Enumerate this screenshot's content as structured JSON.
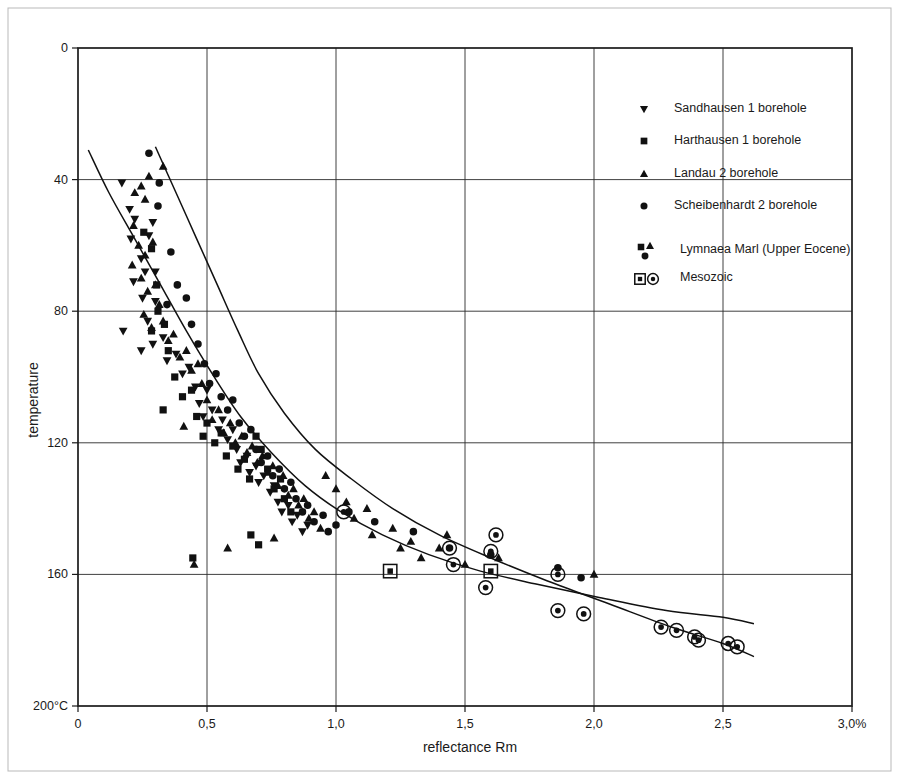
{
  "chart_data": {
    "type": "scatter",
    "title": "",
    "xlabel": "reflectance Rm",
    "ylabel": "temperature",
    "xlim": [
      0,
      3.0
    ],
    "ylim": [
      0,
      200
    ],
    "y_inverted": true,
    "grid": true,
    "x_ticks": [
      "0",
      "0,5",
      "1,0",
      "1,5",
      "2,0",
      "2,5",
      "3,0%"
    ],
    "x_tick_values": [
      0,
      0.5,
      1.0,
      1.5,
      2.0,
      2.5,
      3.0
    ],
    "y_ticks": [
      "0",
      "40",
      "80",
      "120",
      "160",
      "200°C"
    ],
    "y_tick_values": [
      0,
      40,
      80,
      120,
      160,
      200
    ],
    "legend_position": "top-right",
    "legend": [
      {
        "marker": "triangle-down",
        "label": "Sandhausen 1 borehole"
      },
      {
        "marker": "square",
        "label": "Harthausen 1 borehole"
      },
      {
        "marker": "triangle-up",
        "label": "Landau 2 borehole"
      },
      {
        "marker": "circle",
        "label": "Scheibenhardt 2 borehole"
      },
      {
        "marker": "group-cluster",
        "label": "Lymnaea Marl (Upper Eocene)"
      },
      {
        "marker": "outlined-pair",
        "label": "Mesozoic"
      }
    ],
    "annotations": [
      {
        "name": "upper-envelope",
        "description": "upper bounding trend curve"
      },
      {
        "name": "lower-envelope",
        "description": "lower bounding trend curve"
      }
    ],
    "envelopes": {
      "upper": [
        [
          0.04,
          31
        ],
        [
          0.12,
          44
        ],
        [
          0.22,
          58
        ],
        [
          0.32,
          72
        ],
        [
          0.42,
          86
        ],
        [
          0.52,
          99
        ],
        [
          0.63,
          112
        ],
        [
          0.75,
          123
        ],
        [
          0.88,
          133
        ],
        [
          1.02,
          141
        ],
        [
          1.18,
          148
        ],
        [
          1.36,
          154
        ],
        [
          1.56,
          159
        ],
        [
          1.78,
          163
        ],
        [
          2.02,
          167
        ],
        [
          2.28,
          171
        ],
        [
          2.5,
          173
        ],
        [
          2.62,
          175
        ]
      ],
      "lower": [
        [
          0.3,
          30
        ],
        [
          0.38,
          44
        ],
        [
          0.46,
          58
        ],
        [
          0.54,
          72
        ],
        [
          0.62,
          86
        ],
        [
          0.7,
          99
        ],
        [
          0.8,
          111
        ],
        [
          0.92,
          122
        ],
        [
          1.06,
          131
        ],
        [
          1.22,
          140
        ],
        [
          1.4,
          148
        ],
        [
          1.6,
          155
        ],
        [
          1.82,
          162
        ],
        [
          2.06,
          169
        ],
        [
          2.3,
          176
        ],
        [
          2.5,
          181
        ],
        [
          2.62,
          185
        ]
      ]
    },
    "series": [
      {
        "name": "Sandhausen 1 borehole",
        "marker": "triangle-down",
        "points": [
          [
            0.17,
            41
          ],
          [
            0.2,
            49
          ],
          [
            0.22,
            52
          ],
          [
            0.205,
            58
          ],
          [
            0.275,
            57
          ],
          [
            0.29,
            53
          ],
          [
            0.245,
            64
          ],
          [
            0.26,
            68
          ],
          [
            0.215,
            71
          ],
          [
            0.3,
            68
          ],
          [
            0.25,
            76
          ],
          [
            0.3,
            77
          ],
          [
            0.27,
            83
          ],
          [
            0.175,
            86
          ],
          [
            0.245,
            92
          ],
          [
            0.29,
            90
          ],
          [
            0.33,
            88
          ],
          [
            0.345,
            95
          ],
          [
            0.38,
            93
          ],
          [
            0.405,
            99
          ],
          [
            0.43,
            97
          ],
          [
            0.455,
            103
          ],
          [
            0.47,
            108
          ],
          [
            0.5,
            104
          ],
          [
            0.485,
            112
          ],
          [
            0.52,
            110
          ],
          [
            0.545,
            116
          ],
          [
            0.56,
            113
          ],
          [
            0.58,
            119
          ],
          [
            0.6,
            116
          ],
          [
            0.615,
            122
          ],
          [
            0.63,
            126
          ],
          [
            0.655,
            124
          ],
          [
            0.665,
            129
          ],
          [
            0.69,
            127
          ],
          [
            0.7,
            132
          ],
          [
            0.72,
            130
          ],
          [
            0.745,
            135
          ],
          [
            0.76,
            133
          ],
          [
            0.775,
            138
          ],
          [
            0.79,
            141
          ],
          [
            0.815,
            139
          ],
          [
            0.83,
            144
          ],
          [
            0.85,
            142
          ],
          [
            0.87,
            147
          ],
          [
            0.89,
            145
          ]
        ]
      },
      {
        "name": "Harthausen 1 borehole",
        "marker": "square",
        "points": [
          [
            0.255,
            56
          ],
          [
            0.285,
            61
          ],
          [
            0.305,
            72
          ],
          [
            0.31,
            80
          ],
          [
            0.285,
            86
          ],
          [
            0.335,
            84
          ],
          [
            0.35,
            92
          ],
          [
            0.375,
            100
          ],
          [
            0.405,
            106
          ],
          [
            0.33,
            110
          ],
          [
            0.44,
            104
          ],
          [
            0.46,
            112
          ],
          [
            0.485,
            118
          ],
          [
            0.5,
            114
          ],
          [
            0.53,
            120
          ],
          [
            0.555,
            117
          ],
          [
            0.575,
            124
          ],
          [
            0.6,
            121
          ],
          [
            0.62,
            128
          ],
          [
            0.645,
            125
          ],
          [
            0.665,
            131
          ],
          [
            0.69,
            118
          ],
          [
            0.71,
            122
          ],
          [
            0.735,
            128
          ],
          [
            0.76,
            134
          ],
          [
            0.785,
            131
          ],
          [
            0.8,
            137
          ],
          [
            0.825,
            141
          ],
          [
            0.67,
            148
          ],
          [
            0.7,
            151
          ],
          [
            0.445,
            155
          ]
        ]
      },
      {
        "name": "Landau 2 borehole",
        "marker": "triangle-up",
        "points": [
          [
            0.22,
            44
          ],
          [
            0.245,
            42
          ],
          [
            0.26,
            46
          ],
          [
            0.275,
            39
          ],
          [
            0.33,
            36
          ],
          [
            0.215,
            54
          ],
          [
            0.235,
            60
          ],
          [
            0.26,
            63
          ],
          [
            0.29,
            59
          ],
          [
            0.21,
            66
          ],
          [
            0.245,
            70
          ],
          [
            0.27,
            74
          ],
          [
            0.3,
            72
          ],
          [
            0.315,
            78
          ],
          [
            0.255,
            81
          ],
          [
            0.285,
            85
          ],
          [
            0.33,
            83
          ],
          [
            0.35,
            89
          ],
          [
            0.37,
            87
          ],
          [
            0.395,
            94
          ],
          [
            0.42,
            92
          ],
          [
            0.44,
            98
          ],
          [
            0.465,
            96
          ],
          [
            0.48,
            102
          ],
          [
            0.41,
            115
          ],
          [
            0.5,
            107
          ],
          [
            0.52,
            113
          ],
          [
            0.545,
            110
          ],
          [
            0.565,
            117
          ],
          [
            0.59,
            114
          ],
          [
            0.61,
            120
          ],
          [
            0.635,
            118
          ],
          [
            0.655,
            123
          ],
          [
            0.675,
            121
          ],
          [
            0.695,
            126
          ],
          [
            0.715,
            124
          ],
          [
            0.735,
            129
          ],
          [
            0.755,
            127
          ],
          [
            0.775,
            133
          ],
          [
            0.795,
            130
          ],
          [
            0.815,
            136
          ],
          [
            0.835,
            134
          ],
          [
            0.855,
            139
          ],
          [
            0.875,
            137
          ],
          [
            0.895,
            143
          ],
          [
            0.915,
            141
          ],
          [
            0.94,
            146
          ],
          [
            0.96,
            130
          ],
          [
            1.0,
            134
          ],
          [
            1.04,
            138
          ],
          [
            1.07,
            143
          ],
          [
            1.12,
            140
          ],
          [
            1.14,
            148
          ],
          [
            1.22,
            146
          ],
          [
            1.25,
            152
          ],
          [
            1.29,
            150
          ],
          [
            1.33,
            155
          ],
          [
            1.4,
            152
          ],
          [
            1.43,
            148
          ],
          [
            1.5,
            157
          ],
          [
            1.63,
            155
          ],
          [
            2.0,
            160
          ],
          [
            0.45,
            157
          ],
          [
            0.58,
            152
          ],
          [
            0.76,
            149
          ]
        ]
      },
      {
        "name": "Scheibenhardt 2 borehole",
        "marker": "circle",
        "points": [
          [
            0.275,
            32
          ],
          [
            0.315,
            41
          ],
          [
            0.31,
            48
          ],
          [
            0.36,
            62
          ],
          [
            0.385,
            72
          ],
          [
            0.345,
            78
          ],
          [
            0.42,
            76
          ],
          [
            0.44,
            84
          ],
          [
            0.465,
            90
          ],
          [
            0.49,
            96
          ],
          [
            0.51,
            102
          ],
          [
            0.535,
            99
          ],
          [
            0.555,
            106
          ],
          [
            0.58,
            110
          ],
          [
            0.6,
            107
          ],
          [
            0.625,
            114
          ],
          [
            0.645,
            118
          ],
          [
            0.67,
            116
          ],
          [
            0.69,
            122
          ],
          [
            0.71,
            126
          ],
          [
            0.735,
            124
          ],
          [
            0.755,
            130
          ],
          [
            0.78,
            128
          ],
          [
            0.8,
            134
          ],
          [
            0.825,
            132
          ],
          [
            0.845,
            137
          ],
          [
            0.87,
            141
          ],
          [
            0.89,
            139
          ],
          [
            0.915,
            144
          ],
          [
            0.95,
            142
          ],
          [
            0.97,
            147
          ],
          [
            1.0,
            145
          ],
          [
            1.05,
            141
          ],
          [
            1.15,
            144
          ],
          [
            1.3,
            147
          ],
          [
            1.44,
            152
          ],
          [
            1.6,
            154
          ],
          [
            1.86,
            158
          ],
          [
            1.95,
            161
          ]
        ]
      },
      {
        "name": "Lymnaea Marl (Upper Eocene)",
        "marker": "outlined-square",
        "points": [
          [
            1.21,
            159
          ],
          [
            1.6,
            159
          ]
        ]
      },
      {
        "name": "Mesozoic",
        "marker": "outlined-circle",
        "points": [
          [
            1.03,
            141
          ],
          [
            1.44,
            152
          ],
          [
            1.455,
            157
          ],
          [
            1.6,
            153
          ],
          [
            1.62,
            148
          ],
          [
            1.58,
            164
          ],
          [
            1.86,
            160
          ],
          [
            1.86,
            171
          ],
          [
            1.96,
            172
          ],
          [
            2.26,
            176
          ],
          [
            2.32,
            177
          ],
          [
            2.39,
            179
          ],
          [
            2.405,
            180
          ],
          [
            2.52,
            181
          ],
          [
            2.555,
            182
          ]
        ]
      }
    ]
  },
  "page": {
    "border": true
  }
}
